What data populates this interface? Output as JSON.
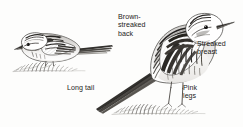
{
  "plate": {
    "kind": "field-guide-bird-illustration",
    "background_color": "#fdfdfc",
    "ink_color": "#1d1c1b",
    "subject": "pipit"
  },
  "labels": {
    "brown_streaked_back": "Brown-\nstreaked\nback",
    "streaked_breast": "Streaked\nbreast",
    "long_tail": "Long tail",
    "pink_legs": "Pink\nlegs"
  },
  "figures": {
    "left_bird": {
      "name": "crouching-pipit",
      "posture": "horizontal crouched, head low, facing left",
      "ground": "grass tuft"
    },
    "right_bird": {
      "name": "standing-pipit",
      "posture": "upright alert, facing right, long tail trailing down-left",
      "ground": "grass tuft"
    }
  }
}
